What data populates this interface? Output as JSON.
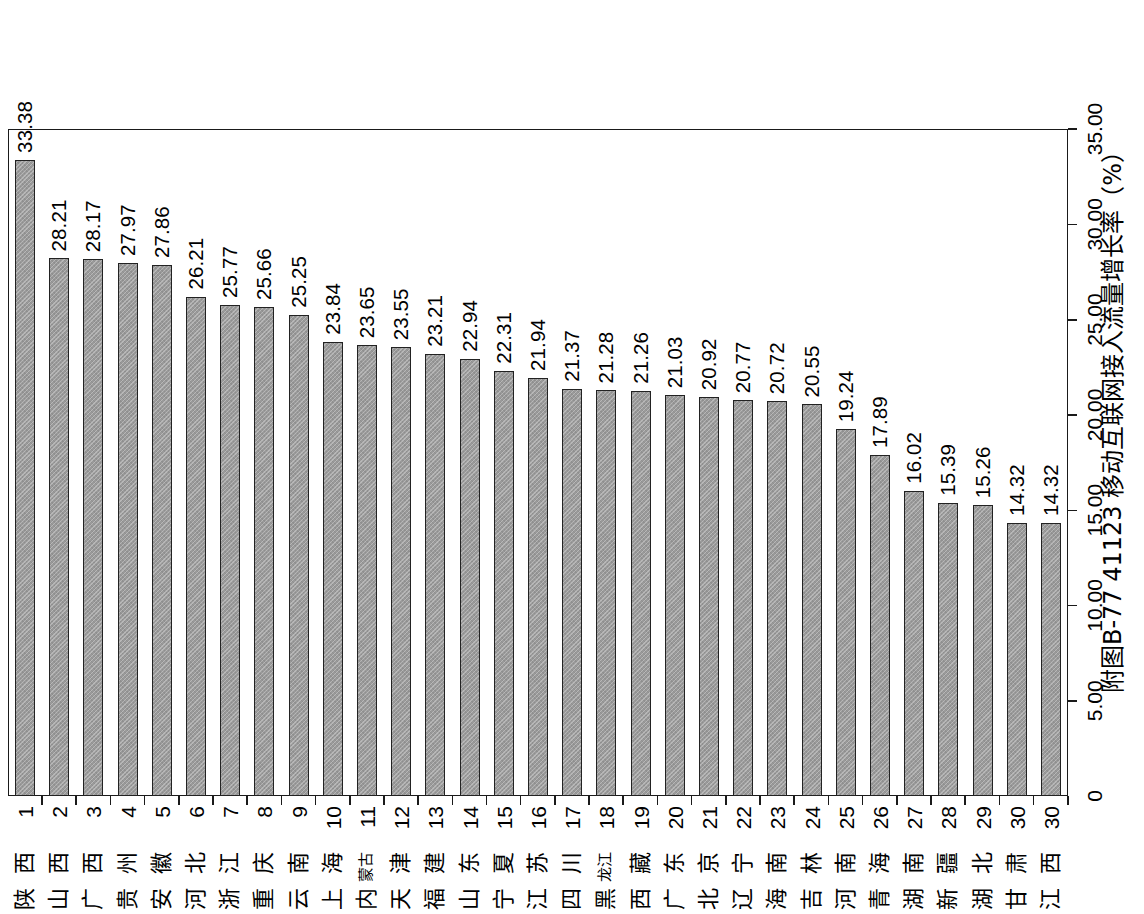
{
  "figure": {
    "caption": "附图B-77  41123 移动互联网接入流量增长率（%）",
    "caption_number": "附图B-77",
    "indicator_code": "41123",
    "indicator_name": "移动互联网接入流量增长率",
    "unit": "%"
  },
  "axis": {
    "value_ticks": [
      "0",
      "5.00",
      "10.00",
      "15.00",
      "20.00",
      "25.00",
      "30.00",
      "35.00"
    ],
    "value_min": 0,
    "value_max": 35,
    "value_step": 5
  },
  "style": {
    "bar_fill": "#9a9a9a",
    "bar_border": "#222222",
    "frame": "#1a1a1a",
    "background": "#ffffff"
  },
  "chart_data": {
    "type": "bar",
    "title": "附图B-77  41123 移动互联网接入流量增长率（%）",
    "xlabel": "",
    "ylabel": "移动互联网接入流量增长率（%）",
    "ylim": [
      0,
      35
    ],
    "grid": false,
    "legend": "none",
    "orientation": "vertical",
    "categories": [
      "陕西",
      "山西",
      "广西",
      "贵州",
      "安徽",
      "河北",
      "浙江",
      "重庆",
      "云南",
      "上海",
      "内蒙古",
      "天津",
      "福建",
      "山东",
      "宁夏",
      "江苏",
      "四川",
      "黑龙江",
      "西藏",
      "广东",
      "北京",
      "辽宁",
      "海南",
      "吉林",
      "河南",
      "青海",
      "湖南",
      "新疆",
      "湖北",
      "甘肃",
      "江西"
    ],
    "ranks": [
      "1",
      "2",
      "3",
      "4",
      "5",
      "6",
      "7",
      "8",
      "9",
      "10",
      "11",
      "12",
      "13",
      "14",
      "15",
      "16",
      "17",
      "18",
      "19",
      "20",
      "21",
      "22",
      "23",
      "24",
      "25",
      "26",
      "27",
      "28",
      "29",
      "30",
      "30"
    ],
    "values": [
      33.38,
      28.21,
      28.17,
      27.97,
      27.86,
      26.21,
      25.77,
      25.66,
      25.25,
      23.84,
      23.65,
      23.55,
      23.21,
      22.94,
      22.31,
      21.94,
      21.37,
      21.28,
      21.26,
      21.03,
      20.92,
      20.77,
      20.72,
      20.55,
      19.24,
      17.89,
      16.02,
      15.39,
      15.26,
      14.32,
      14.32
    ],
    "value_labels": [
      "33.38",
      "28.21",
      "28.17",
      "27.97",
      "27.86",
      "26.21",
      "25.77",
      "25.66",
      "25.25",
      "23.84",
      "23.65",
      "23.55",
      "23.21",
      "22.94",
      "22.31",
      "21.94",
      "21.37",
      "21.28",
      "21.26",
      "21.03",
      "20.92",
      "20.77",
      "20.72",
      "20.55",
      "19.24",
      "17.89",
      "16.02",
      "15.39",
      "15.26",
      "14.32",
      "14.32"
    ]
  }
}
